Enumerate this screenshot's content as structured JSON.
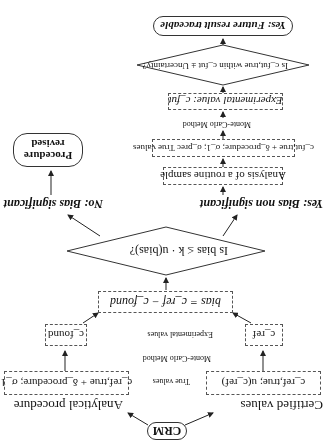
{
  "crm": {
    "label": "CRM"
  },
  "left_branch": {
    "title": "Certified values",
    "box1": "c_ref,true; u(c_ref)",
    "box2": "c_ref"
  },
  "right_branch": {
    "title": "Analytical procedure",
    "box1": "c_ref,true + δ_procedure; σ_1",
    "box2": "c_found"
  },
  "middle_labels": {
    "true_values": "True values",
    "monte_carlo": "Monte-Carlo Method",
    "experimental": "Experimental values"
  },
  "bias_box": "bias = c_ref − c_found",
  "decision1": "Is bias ≤ k · u(bias)?",
  "no_branch": {
    "label": "No: Bias significant",
    "result_line1": "Procedure",
    "result_line2": "revised"
  },
  "yes_branch": {
    "label": "Yes: Bias non significant",
    "analysis_box": "Analysis of a routine sample",
    "true_values_box": "c_fut,true + δ_procedure; σ_1; σ_prec   True values",
    "monte_carlo": "Monte-Carlo Method",
    "experimental_box": "Experimental value: c_fut",
    "decision2": "Is c_fut,true within c_fut ± Uncertainty?",
    "result": "Yes: Future result traceable"
  }
}
